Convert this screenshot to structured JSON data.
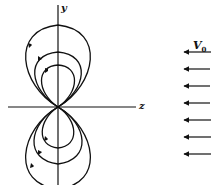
{
  "diagram": {
    "axes": {
      "vertical_label": "y",
      "horizontal_label": "z"
    },
    "flow": {
      "label_main": "V",
      "label_sub": "0",
      "direction": "negative z (leftward)",
      "arrow_count": 7
    },
    "field_lines": {
      "upper_loops": 3,
      "lower_loops": 3,
      "upper_circulation": "counterclockwise (arrows pointing down on left side)",
      "lower_circulation": "clockwise (arrows pointing up on left side)"
    },
    "colors": {
      "line": "#111111",
      "background": "#ffffff"
    }
  }
}
